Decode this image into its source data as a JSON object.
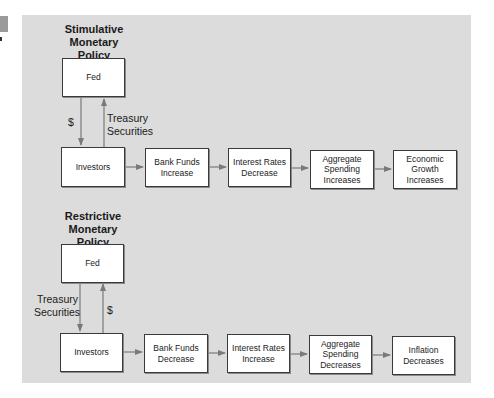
{
  "stimulative": {
    "title_line1": "Stimulative Monetary",
    "title_line2": "Policy",
    "fed": "Fed",
    "down_label": "$",
    "up_label_line1": "Treasury",
    "up_label_line2": "Securities",
    "chain": [
      {
        "line1": "Investors",
        "line2": "",
        "line3": ""
      },
      {
        "line1": "Bank Funds",
        "line2": "Increase",
        "line3": ""
      },
      {
        "line1": "Interest Rates",
        "line2": "Decrease",
        "line3": ""
      },
      {
        "line1": "Aggregate",
        "line2": "Spending",
        "line3": "Increases"
      },
      {
        "line1": "Economic",
        "line2": "Growth",
        "line3": "Increases"
      }
    ]
  },
  "restrictive": {
    "title_line1": "Restrictive Monetary",
    "title_line2": "Policy",
    "fed": "Fed",
    "down_label_line1": "Treasury",
    "down_label_line2": "Securities",
    "up_label": "$",
    "chain": [
      {
        "line1": "Investors",
        "line2": "",
        "line3": ""
      },
      {
        "line1": "Bank Funds",
        "line2": "Decrease",
        "line3": ""
      },
      {
        "line1": "Interest Rates",
        "line2": "Increase",
        "line3": ""
      },
      {
        "line1": "Aggregate",
        "line2": "Spending",
        "line3": "Decreases"
      },
      {
        "line1": "Inflation",
        "line2": "Decreases",
        "line3": ""
      }
    ]
  },
  "colors": {
    "panel": "#dcdcdc",
    "box_border": "#3a3a3a",
    "arrow": "#7a7a7a"
  }
}
